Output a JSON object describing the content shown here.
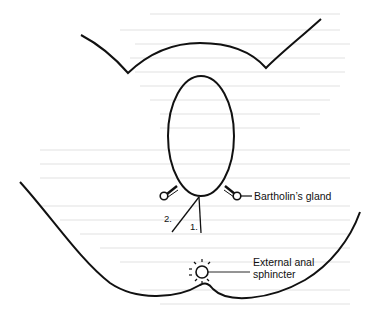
{
  "diagram": {
    "type": "anatomical line drawing",
    "labels": {
      "bartholins_gland": "Bartholin’s gland",
      "external_anal_sphincter_line1": "External anal",
      "external_anal_sphincter_line2": "sphincter",
      "incision_1": "1.",
      "incision_2": "2."
    },
    "colors": {
      "line": "#111111",
      "background": "#ffffff",
      "faint_text": "#ececec"
    }
  }
}
